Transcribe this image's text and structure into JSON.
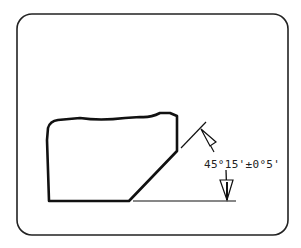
{
  "diagram": {
    "type": "technical-drawing",
    "frame": {
      "style": "rounded-rectangle",
      "stroke": "#222222"
    },
    "block": {
      "stroke": "#111111",
      "feature": "chamfer"
    },
    "dimension": {
      "label": "45°15'±0°5'",
      "nominal_degrees": 45,
      "nominal_minutes": 15,
      "tolerance": "±0°5'"
    },
    "colors": {
      "line": "#111111",
      "background": "#ffffff"
    }
  }
}
